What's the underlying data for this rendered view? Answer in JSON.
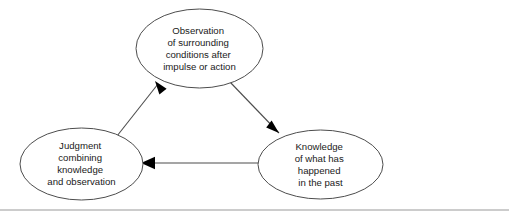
{
  "diagram": {
    "background_color": "#ffffff",
    "node_stroke_color": "#4d4d4d",
    "edge_color": "#4d4d4d",
    "arrowhead_color": "#000000",
    "text_color": "#1a1a1a",
    "rule_color": "#999999",
    "nodes": [
      {
        "id": "observation",
        "shape": "ellipse",
        "cx": 199.5,
        "cy": 48.5,
        "rx": 63.5,
        "ry": 39.5,
        "lines": [
          "Observation",
          "of surrounding",
          "conditions after",
          "impulse or action"
        ]
      },
      {
        "id": "judgment",
        "shape": "ellipse",
        "cx": 81.5,
        "cy": 164,
        "rx": 61.5,
        "ry": 36,
        "lines": [
          "Judgment",
          "combining",
          "knowledge",
          "and observation"
        ]
      },
      {
        "id": "knowledge",
        "shape": "ellipse",
        "cx": 320.5,
        "cy": 164.5,
        "rx": 62.5,
        "ry": 34.5,
        "lines": [
          "Knowledge",
          "of what has",
          "happened",
          "in the past"
        ]
      }
    ],
    "edges": [
      {
        "id": "observation-to-knowledge",
        "from": "observation",
        "to": "knowledge",
        "path": "M 229,81 L 279,133",
        "arrow_points": "279,133 266.2,127.4 271.6,120.6",
        "direction": "down-right"
      },
      {
        "id": "knowledge-to-judgment",
        "from": "knowledge",
        "to": "judgment",
        "path": "M 258,163 L 145,163",
        "arrow_points": "141,163 155,156.8 155,169.2",
        "direction": "left"
      },
      {
        "id": "judgment-to-observation",
        "from": "judgment",
        "to": "observation",
        "path": "M 117,136 L 158,84",
        "arrow_points": "155,81 159.4,94.6 166.6,88.8",
        "direction": "up-right"
      }
    ],
    "footer_rule": {
      "y": 210,
      "x1": 0,
      "x2": 509
    }
  }
}
